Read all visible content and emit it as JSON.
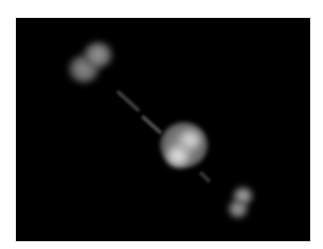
{
  "image": {
    "description": "Dark-field rendering of a linear three-body structure: a large bright central sphere with two lobes, a dumbbell-shaped blob at upper-left and a smaller dumbbell blob at lower-right, joined by faint diagonal rod segments",
    "background_color": "#000000",
    "border_color": "#cfcfcf",
    "page_color": "#ffffff"
  },
  "objects": {
    "upper_left_blob": {
      "color": "#9a9a9a",
      "lobes": 2
    },
    "central_sphere": {
      "color": "#d8d8d8",
      "lobes": 2
    },
    "lower_right_blob": {
      "color": "#a8a8a8",
      "lobes": 2
    },
    "connector_rods": {
      "color": "#3a3a3a",
      "segments": 3
    }
  }
}
